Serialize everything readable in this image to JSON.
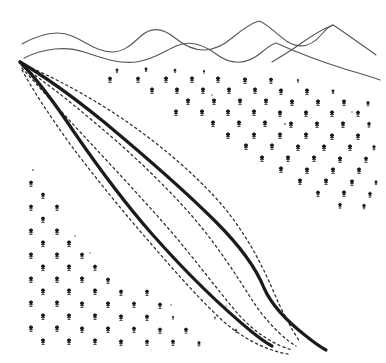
{
  "figure": {
    "title": "Hand-drawn terrain sketch of a forested valley",
    "width": 386,
    "height": 363,
    "background_color": "#ffffff",
    "style": "line-drawing"
  },
  "colors": {
    "background": "#ffffff",
    "ridge_line": "#55555a",
    "valley_edge_thick": "#1b1b1b",
    "contour_dashed": "#2a2a2a",
    "tree_symbol": "#1a1a1a"
  },
  "strokes": {
    "ridge_width": 1.1,
    "valley_edge_width": 3.2,
    "contour_width": 1.25,
    "contour_dash_pattern": "2.2 3.2"
  },
  "ridges": {
    "label": "mountain-ridge-lines",
    "count": 4,
    "paths": [
      {
        "name": "back-ridge-left",
        "d": "M 22 44 C 40 34 58 30 72 36 C 88 43 98 52 112 52 C 124 52 132 44 141 36 C 152 26 163 28 175 38 C 196 55 214 53 232 38 C 244 28 252 23 259 21 C 268 24 276 34 288 42"
      },
      {
        "name": "back-ridge-right-peak",
        "d": "M 288 42 C 300 49 312 46 322 34 C 327 28 330 26 333 25 C 340 29 350 37 362 45 C 368 49 372 52 376 55"
      },
      {
        "name": "front-ridge",
        "d": "M 24 58 C 44 48 66 46 84 52 C 102 58 118 64 136 62 C 152 60 163 52 176 46 C 190 40 203 44 216 54 C 232 66 248 64 262 52 C 268 47 272 44 276 43 C 296 52 322 62 348 70 C 362 74 372 77 380 80"
      },
      {
        "name": "ridge-saddle-connector",
        "d": "M 272 62 C 282 56 292 50 300 44 C 310 37 320 30 333 25"
      }
    ]
  },
  "valley_edges": {
    "label": "valley-boundary-thick-curves",
    "count": 2,
    "paths": [
      {
        "name": "left-valley-edge",
        "d": "M 20 62 C 36 78 54 102 74 132 C 96 164 122 200 152 234 C 182 268 218 304 252 332 C 262 340 268 344 272 346"
      },
      {
        "name": "right-valley-edge",
        "d": "M 20 62 C 44 76 72 96 104 122 C 140 152 180 186 216 222 C 240 246 256 268 264 288 C 272 306 288 322 306 336 C 316 344 322 348 326 350"
      }
    ]
  },
  "contours": {
    "label": "dashed-contour-lines",
    "count": 4,
    "origin": {
      "x": 18,
      "y": 60
    },
    "convergence": {
      "x": 300,
      "y": 344
    },
    "paths": [
      {
        "name": "contour-1-outer",
        "d": "M 22 64 C 46 74 74 88 106 108 C 144 132 182 162 214 196 C 240 224 258 256 272 288 C 282 312 292 330 300 342"
      },
      {
        "name": "contour-2",
        "d": "M 22 66 C 42 80 66 98 94 122 C 128 150 162 182 192 216 C 218 246 238 278 256 306 C 272 328 286 340 296 346"
      },
      {
        "name": "contour-3",
        "d": "M 22 68 C 38 86 58 108 82 134 C 110 164 140 196 168 228 C 194 258 216 288 238 314 C 258 336 278 346 292 350"
      },
      {
        "name": "contour-4-inner",
        "d": "M 22 70 C 34 92 50 116 70 144 C 94 176 120 208 146 238 C 172 268 198 298 224 322 C 250 344 274 352 288 354"
      }
    ]
  },
  "tree_symbol": {
    "name": "tree-symbol",
    "description": "small stylized tree with rounded canopy and short trunk with base",
    "width": 7,
    "height": 9
  },
  "forest_regions": [
    {
      "name": "upper-right-forest",
      "description": "dense stippled tree field on the right slope above the valley",
      "tree_count": 74,
      "trees": [
        {
          "x": 117,
          "y": 71,
          "s": 0.62
        },
        {
          "x": 146,
          "y": 70,
          "s": 0.62
        },
        {
          "x": 175,
          "y": 71,
          "s": 0.6
        },
        {
          "x": 204,
          "y": 72,
          "s": 0.48
        },
        {
          "x": 110,
          "y": 80,
          "s": 0.88
        },
        {
          "x": 138,
          "y": 80,
          "s": 0.88
        },
        {
          "x": 166,
          "y": 80,
          "s": 0.9
        },
        {
          "x": 192,
          "y": 80,
          "s": 0.9
        },
        {
          "x": 218,
          "y": 80,
          "s": 0.9
        },
        {
          "x": 245,
          "y": 81,
          "s": 0.9
        },
        {
          "x": 271,
          "y": 81,
          "s": 0.86
        },
        {
          "x": 298,
          "y": 81,
          "s": 0.5
        },
        {
          "x": 152,
          "y": 91,
          "s": 0.9
        },
        {
          "x": 177,
          "y": 91,
          "s": 0.9
        },
        {
          "x": 203,
          "y": 91,
          "s": 0.9
        },
        {
          "x": 229,
          "y": 91,
          "s": 0.9
        },
        {
          "x": 255,
          "y": 91,
          "s": 0.9
        },
        {
          "x": 281,
          "y": 92,
          "s": 0.9
        },
        {
          "x": 307,
          "y": 92,
          "s": 0.9
        },
        {
          "x": 333,
          "y": 92,
          "s": 0.62
        },
        {
          "x": 188,
          "y": 102,
          "s": 0.92
        },
        {
          "x": 214,
          "y": 102,
          "s": 0.92
        },
        {
          "x": 240,
          "y": 102,
          "s": 0.92
        },
        {
          "x": 266,
          "y": 102,
          "s": 0.92
        },
        {
          "x": 292,
          "y": 103,
          "s": 0.92
        },
        {
          "x": 318,
          "y": 103,
          "s": 0.92
        },
        {
          "x": 344,
          "y": 103,
          "s": 0.9
        },
        {
          "x": 368,
          "y": 104,
          "s": 0.74
        },
        {
          "x": 176,
          "y": 113,
          "s": 0.9
        },
        {
          "x": 202,
          "y": 113,
          "s": 0.92
        },
        {
          "x": 228,
          "y": 113,
          "s": 0.92
        },
        {
          "x": 254,
          "y": 113,
          "s": 0.92
        },
        {
          "x": 280,
          "y": 114,
          "s": 0.92
        },
        {
          "x": 306,
          "y": 114,
          "s": 0.92
        },
        {
          "x": 332,
          "y": 114,
          "s": 0.92
        },
        {
          "x": 358,
          "y": 114,
          "s": 0.88
        },
        {
          "x": 213,
          "y": 124,
          "s": 0.92
        },
        {
          "x": 239,
          "y": 124,
          "s": 0.92
        },
        {
          "x": 265,
          "y": 124,
          "s": 0.92
        },
        {
          "x": 291,
          "y": 125,
          "s": 0.92
        },
        {
          "x": 317,
          "y": 125,
          "s": 0.92
        },
        {
          "x": 343,
          "y": 125,
          "s": 0.92
        },
        {
          "x": 369,
          "y": 125,
          "s": 0.8
        },
        {
          "x": 228,
          "y": 136,
          "s": 0.92
        },
        {
          "x": 254,
          "y": 136,
          "s": 0.92
        },
        {
          "x": 280,
          "y": 136,
          "s": 0.92
        },
        {
          "x": 306,
          "y": 136,
          "s": 0.92
        },
        {
          "x": 332,
          "y": 137,
          "s": 0.92
        },
        {
          "x": 358,
          "y": 137,
          "s": 0.9
        },
        {
          "x": 246,
          "y": 147,
          "s": 0.92
        },
        {
          "x": 272,
          "y": 147,
          "s": 0.92
        },
        {
          "x": 298,
          "y": 148,
          "s": 0.92
        },
        {
          "x": 324,
          "y": 148,
          "s": 0.92
        },
        {
          "x": 350,
          "y": 148,
          "s": 0.92
        },
        {
          "x": 374,
          "y": 148,
          "s": 0.72
        },
        {
          "x": 262,
          "y": 159,
          "s": 0.92
        },
        {
          "x": 288,
          "y": 159,
          "s": 0.92
        },
        {
          "x": 314,
          "y": 159,
          "s": 0.92
        },
        {
          "x": 340,
          "y": 160,
          "s": 0.92
        },
        {
          "x": 366,
          "y": 160,
          "s": 0.86
        },
        {
          "x": 281,
          "y": 170,
          "s": 0.92
        },
        {
          "x": 307,
          "y": 171,
          "s": 0.92
        },
        {
          "x": 333,
          "y": 171,
          "s": 0.92
        },
        {
          "x": 359,
          "y": 171,
          "s": 0.9
        },
        {
          "x": 300,
          "y": 182,
          "s": 0.9
        },
        {
          "x": 326,
          "y": 182,
          "s": 0.92
        },
        {
          "x": 352,
          "y": 183,
          "s": 0.9
        },
        {
          "x": 376,
          "y": 183,
          "s": 0.66
        },
        {
          "x": 318,
          "y": 194,
          "s": 0.88
        },
        {
          "x": 344,
          "y": 194,
          "s": 0.9
        },
        {
          "x": 370,
          "y": 195,
          "s": 0.82
        },
        {
          "x": 340,
          "y": 206,
          "s": 0.82
        },
        {
          "x": 364,
          "y": 207,
          "s": 0.76
        }
      ]
    },
    {
      "name": "lower-left-forest",
      "description": "stippled tree field on the left foreground slope below the valley",
      "tree_count": 52,
      "trees": [
        {
          "x": 31,
          "y": 184,
          "s": 0.86
        },
        {
          "x": 43,
          "y": 196,
          "s": 0.86
        },
        {
          "x": 31,
          "y": 208,
          "s": 0.88
        },
        {
          "x": 57,
          "y": 208,
          "s": 0.88
        },
        {
          "x": 43,
          "y": 220,
          "s": 0.88
        },
        {
          "x": 31,
          "y": 232,
          "s": 0.9
        },
        {
          "x": 57,
          "y": 232,
          "s": 0.9
        },
        {
          "x": 43,
          "y": 244,
          "s": 0.9
        },
        {
          "x": 69,
          "y": 244,
          "s": 0.9
        },
        {
          "x": 31,
          "y": 256,
          "s": 0.9
        },
        {
          "x": 57,
          "y": 256,
          "s": 0.9
        },
        {
          "x": 82,
          "y": 256,
          "s": 0.88
        },
        {
          "x": 43,
          "y": 268,
          "s": 0.9
        },
        {
          "x": 69,
          "y": 268,
          "s": 0.9
        },
        {
          "x": 95,
          "y": 268,
          "s": 0.88
        },
        {
          "x": 31,
          "y": 280,
          "s": 0.9
        },
        {
          "x": 57,
          "y": 280,
          "s": 0.9
        },
        {
          "x": 82,
          "y": 280,
          "s": 0.9
        },
        {
          "x": 108,
          "y": 281,
          "s": 0.88
        },
        {
          "x": 43,
          "y": 292,
          "s": 0.9
        },
        {
          "x": 69,
          "y": 292,
          "s": 0.9
        },
        {
          "x": 95,
          "y": 292,
          "s": 0.9
        },
        {
          "x": 121,
          "y": 293,
          "s": 0.88
        },
        {
          "x": 147,
          "y": 293,
          "s": 0.86
        },
        {
          "x": 31,
          "y": 304,
          "s": 0.9
        },
        {
          "x": 57,
          "y": 304,
          "s": 0.9
        },
        {
          "x": 82,
          "y": 305,
          "s": 0.9
        },
        {
          "x": 108,
          "y": 305,
          "s": 0.9
        },
        {
          "x": 134,
          "y": 305,
          "s": 0.88
        },
        {
          "x": 160,
          "y": 306,
          "s": 0.86
        },
        {
          "x": 43,
          "y": 317,
          "s": 0.9
        },
        {
          "x": 69,
          "y": 317,
          "s": 0.9
        },
        {
          "x": 95,
          "y": 317,
          "s": 0.9
        },
        {
          "x": 121,
          "y": 318,
          "s": 0.9
        },
        {
          "x": 147,
          "y": 318,
          "s": 0.88
        },
        {
          "x": 173,
          "y": 318,
          "s": 0.5
        },
        {
          "x": 31,
          "y": 329,
          "s": 0.9
        },
        {
          "x": 57,
          "y": 329,
          "s": 0.9
        },
        {
          "x": 82,
          "y": 330,
          "s": 0.9
        },
        {
          "x": 108,
          "y": 330,
          "s": 0.9
        },
        {
          "x": 134,
          "y": 330,
          "s": 0.88
        },
        {
          "x": 160,
          "y": 331,
          "s": 0.86
        },
        {
          "x": 186,
          "y": 331,
          "s": 0.84
        },
        {
          "x": 43,
          "y": 342,
          "s": 0.9
        },
        {
          "x": 69,
          "y": 342,
          "s": 0.9
        },
        {
          "x": 95,
          "y": 342,
          "s": 0.9
        },
        {
          "x": 121,
          "y": 343,
          "s": 0.9
        },
        {
          "x": 147,
          "y": 343,
          "s": 0.88
        },
        {
          "x": 173,
          "y": 343,
          "s": 0.86
        },
        {
          "x": 199,
          "y": 344,
          "s": 0.7
        },
        {
          "x": 236,
          "y": 331,
          "s": 0.5
        },
        {
          "x": 215,
          "y": 318,
          "s": 0.38
        }
      ]
    }
  ],
  "speck_marks": {
    "label": "incidental-ink-specks",
    "marks": [
      {
        "x": 33,
        "y": 170,
        "r": 0.9
      },
      {
        "x": 75,
        "y": 236,
        "r": 0.8
      },
      {
        "x": 90,
        "y": 253,
        "r": 0.7
      },
      {
        "x": 285,
        "y": 124,
        "r": 0.9
      },
      {
        "x": 212,
        "y": 95,
        "r": 0.8
      },
      {
        "x": 171,
        "y": 305,
        "r": 0.8
      },
      {
        "x": 226,
        "y": 306,
        "r": 0.7
      },
      {
        "x": 352,
        "y": 112,
        "r": 0.8
      }
    ]
  }
}
